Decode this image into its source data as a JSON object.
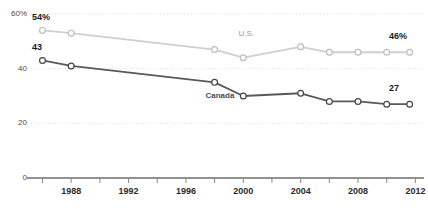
{
  "chart_data": {
    "type": "line",
    "title": "",
    "subtitle": "",
    "xlabel": "",
    "ylabel": "",
    "xlim": [
      1985.2,
      2012.6
    ],
    "ylim": [
      0,
      60
    ],
    "grid": true,
    "grid_axis": "y",
    "legend_position": "inline-annotation",
    "x_tick_step": 2,
    "x_label_step": 4,
    "x_ticks": [
      1986,
      1988,
      1990,
      1992,
      1994,
      1996,
      1998,
      2000,
      2002,
      2004,
      2006,
      2008,
      2010,
      2012
    ],
    "x_tick_labels": [
      "",
      "1988",
      "",
      "1992",
      "",
      "1996",
      "",
      "2000",
      "",
      "2004",
      "",
      "2008",
      "",
      "2012"
    ],
    "y_ticks": [
      0,
      20,
      40,
      60
    ],
    "y_tick_labels": [
      "0",
      "20",
      "40",
      "60%"
    ],
    "series": [
      {
        "name": "U.S.",
        "color": "#cfcfcf",
        "marker_edge": "#bdbdbd",
        "marker_face": "#ffffff",
        "label_start": "54%",
        "label_end": "46%",
        "x": [
          1986,
          1988,
          1998,
          2000,
          2004,
          2006,
          2008,
          2010,
          2011.6
        ],
        "values": [
          54,
          53,
          47,
          44,
          48,
          46,
          46,
          46,
          46
        ]
      },
      {
        "name": "Canada",
        "color": "#595959",
        "marker_edge": "#444444",
        "marker_face": "#ffffff",
        "label_start": "43",
        "label_end": "27",
        "x": [
          1986,
          1988,
          1998,
          2000,
          2004,
          2006,
          2008,
          2010,
          2011.6
        ],
        "values": [
          43,
          41,
          35,
          30,
          31,
          28,
          28,
          27,
          27
        ]
      }
    ],
    "annotations": [
      {
        "name": "us-series-label",
        "text": "U.S.",
        "x": 2000.5,
        "y": 52.5
      },
      {
        "name": "canada-series-label",
        "text": "Canada",
        "x": 1998.2,
        "y": 29.5
      },
      {
        "name": "us-start-value",
        "text": "54%",
        "x": 1986.1,
        "y": 58.5
      },
      {
        "name": "us-end-value",
        "text": "46%",
        "x": 2011.0,
        "y": 51.5
      },
      {
        "name": "canada-start-value",
        "text": "43",
        "x": 1986.1,
        "y": 47.5
      },
      {
        "name": "canada-end-value",
        "text": "27",
        "x": 2011.0,
        "y": 32.5
      }
    ]
  }
}
